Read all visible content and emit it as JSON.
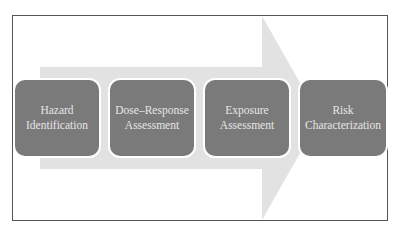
{
  "diagram": {
    "type": "process-flow",
    "colors": {
      "frame_border": "#555555",
      "arrow_fill": "#e2e2e2",
      "box_fill": "#7a7a7a",
      "box_text": "#e6e6e6"
    },
    "steps": [
      {
        "line1": "Hazard",
        "line2": "Identification"
      },
      {
        "line1": "Dose–Response",
        "line2": "Assessment"
      },
      {
        "line1": "Exposure",
        "line2": "Assessment"
      },
      {
        "line1": "Risk",
        "line2": "Characterization"
      }
    ]
  }
}
